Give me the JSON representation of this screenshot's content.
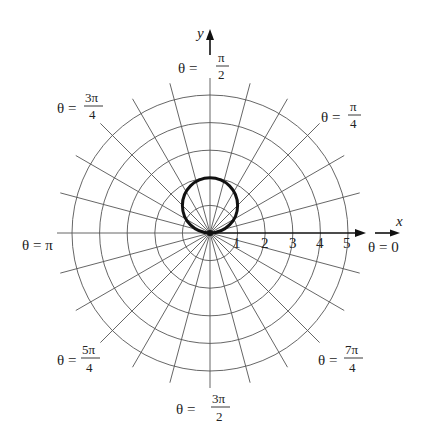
{
  "figure": {
    "type": "polar-graph",
    "origin_px": [
      210,
      233
    ],
    "unit_px": 27.6,
    "grid": {
      "circle_radii": [
        1,
        2,
        3,
        4,
        5
      ],
      "radial_step_degrees": 15,
      "radial_length_px": 155
    },
    "curve": {
      "equation": "r = 2 sin θ",
      "center": [
        0,
        1
      ],
      "radius": 1
    },
    "axes": {
      "x_label": "x",
      "y_label": "y",
      "tick_labels": [
        "1",
        "2",
        "3",
        "4",
        "5"
      ]
    },
    "angle_labels": [
      {
        "id": "zero",
        "theta": "θ = 0"
      },
      {
        "id": "pi-4",
        "theta": "θ =",
        "num": "π",
        "den": "4"
      },
      {
        "id": "pi-2",
        "theta": "θ =",
        "num": "π",
        "den": "2"
      },
      {
        "id": "3pi-4",
        "theta": "θ =",
        "num": "3π",
        "den": "4"
      },
      {
        "id": "pi",
        "theta": "θ = π"
      },
      {
        "id": "5pi-4",
        "theta": "θ =",
        "num": "5π",
        "den": "4"
      },
      {
        "id": "3pi-2",
        "theta": "θ =",
        "num": "3π",
        "den": "2"
      },
      {
        "id": "7pi-4",
        "theta": "θ =",
        "num": "7π",
        "den": "4"
      }
    ]
  }
}
